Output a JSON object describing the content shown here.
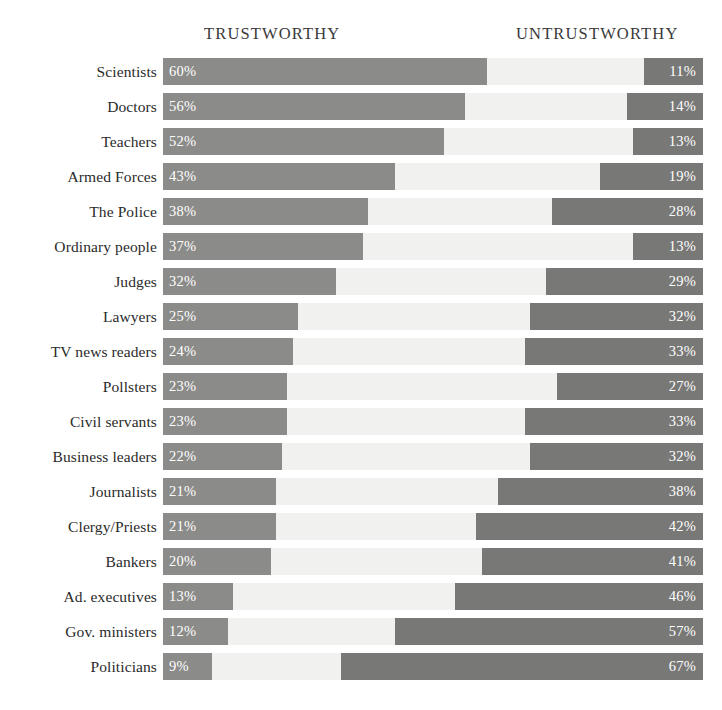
{
  "header": {
    "left_label": "TRUSTWORTHY",
    "right_label": "UNTRUSTWORTHY"
  },
  "colors": {
    "trustworthy_bar": "#8b8b89",
    "untrustworthy_bar": "#787876",
    "track": "#f1f1ef",
    "background": "#ffffff",
    "label_text": "#2a2a2a",
    "value_text": "#ffffff"
  },
  "chart_data": {
    "type": "bar",
    "title": "",
    "subtitle": "",
    "xlabel": "",
    "ylabel": "",
    "xlim": [
      0,
      100
    ],
    "grid": false,
    "legend_position": "top",
    "orientation": "horizontal",
    "layout": "diverging-opposed",
    "value_suffix": "%",
    "categories": [
      "Scientists",
      "Doctors",
      "Teachers",
      "Armed Forces",
      "The Police",
      "Ordinary people",
      "Judges",
      "Lawyers",
      "TV news readers",
      "Pollsters",
      "Civil servants",
      "Business leaders",
      "Journalists",
      "Clergy/Priests",
      "Bankers",
      "Ad. executives",
      "Gov. ministers",
      "Politicians"
    ],
    "series": [
      {
        "name": "TRUSTWORTHY",
        "align": "left",
        "color": "#8b8b89",
        "values": [
          60,
          56,
          52,
          43,
          38,
          37,
          32,
          25,
          24,
          23,
          23,
          22,
          21,
          21,
          20,
          13,
          12,
          9
        ]
      },
      {
        "name": "UNTRUSTWORTHY",
        "align": "right",
        "color": "#787876",
        "values": [
          11,
          14,
          13,
          19,
          28,
          13,
          29,
          32,
          33,
          27,
          33,
          32,
          38,
          42,
          41,
          46,
          57,
          67
        ]
      }
    ]
  },
  "rows": [
    {
      "label": "Scientists",
      "left": 60,
      "right": 11,
      "left_text": "60%",
      "right_text": "11%"
    },
    {
      "label": "Doctors",
      "left": 56,
      "right": 14,
      "left_text": "56%",
      "right_text": "14%"
    },
    {
      "label": "Teachers",
      "left": 52,
      "right": 13,
      "left_text": "52%",
      "right_text": "13%"
    },
    {
      "label": "Armed Forces",
      "left": 43,
      "right": 19,
      "left_text": "43%",
      "right_text": "19%"
    },
    {
      "label": "The Police",
      "left": 38,
      "right": 28,
      "left_text": "38%",
      "right_text": "28%"
    },
    {
      "label": "Ordinary people",
      "left": 37,
      "right": 13,
      "left_text": "37%",
      "right_text": "13%"
    },
    {
      "label": "Judges",
      "left": 32,
      "right": 29,
      "left_text": "32%",
      "right_text": "29%"
    },
    {
      "label": "Lawyers",
      "left": 25,
      "right": 32,
      "left_text": "25%",
      "right_text": "32%"
    },
    {
      "label": "TV news readers",
      "left": 24,
      "right": 33,
      "left_text": "24%",
      "right_text": "33%"
    },
    {
      "label": "Pollsters",
      "left": 23,
      "right": 27,
      "left_text": "23%",
      "right_text": "27%"
    },
    {
      "label": "Civil servants",
      "left": 23,
      "right": 33,
      "left_text": "23%",
      "right_text": "33%"
    },
    {
      "label": "Business leaders",
      "left": 22,
      "right": 32,
      "left_text": "22%",
      "right_text": "32%"
    },
    {
      "label": "Journalists",
      "left": 21,
      "right": 38,
      "left_text": "21%",
      "right_text": "38%"
    },
    {
      "label": "Clergy/Priests",
      "left": 21,
      "right": 42,
      "left_text": "21%",
      "right_text": "42%"
    },
    {
      "label": "Bankers",
      "left": 20,
      "right": 41,
      "left_text": "20%",
      "right_text": "41%"
    },
    {
      "label": "Ad. executives",
      "left": 13,
      "right": 46,
      "left_text": "13%",
      "right_text": "46%"
    },
    {
      "label": "Gov. ministers",
      "left": 12,
      "right": 57,
      "left_text": "12%",
      "right_text": "57%"
    },
    {
      "label": "Politicians",
      "left": 9,
      "right": 67,
      "left_text": "9%",
      "right_text": "67%"
    }
  ]
}
